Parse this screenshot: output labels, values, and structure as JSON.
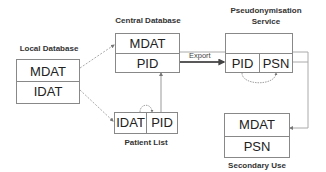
{
  "nodes": {
    "local_db": {
      "title": "Local Database",
      "rows": [
        "MDAT",
        "IDAT"
      ]
    },
    "central_db": {
      "title": "Central Database",
      "rows": [
        "MDAT",
        "PID"
      ]
    },
    "patient_list": {
      "title": "Patient List",
      "cells": [
        "IDAT",
        "PID"
      ]
    },
    "pseudo_service": {
      "title_line1": "Pseudonymisation",
      "title_line2": "Service",
      "cells": [
        "PID",
        "PSN"
      ]
    },
    "secondary_use": {
      "title": "Secondary Use",
      "rows": [
        "MDAT",
        "PSN"
      ]
    }
  },
  "edges": {
    "export": {
      "label": "Export",
      "from": "central_db.PID",
      "to": "pseudo_service.PID"
    }
  },
  "colors": {
    "line": "#999999",
    "arrow": "#222222",
    "border": "#888888"
  }
}
